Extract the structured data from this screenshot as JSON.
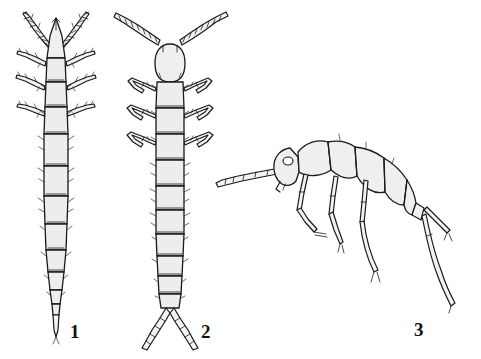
{
  "plate": {
    "background_color": "#ffffff",
    "ink_color": "#1a1a1a",
    "body_fill_color": "#ededed",
    "body_fill_light": "#f4f4f4",
    "width": 481,
    "height": 359
  },
  "figures": [
    {
      "id": "figure-1",
      "label": "1",
      "view": "dorsal",
      "description": "elongate larva, dorsal view, triangular head with two spiny antennae, three pairs of spiny legs, tapering segmented abdomen ending in a point",
      "segment_count": 11,
      "leg_pairs": 3,
      "antenna_type": "spiny",
      "cerci": "none"
    },
    {
      "id": "figure-2",
      "label": "2",
      "view": "dorsal",
      "description": "elongate larva, dorsal view, rounded head with long beaded segmented antennae in a V, three pairs of bent legs, parallel-sided abdomen ending in two segmented cerci",
      "segment_count": 11,
      "leg_pairs": 3,
      "antenna_type": "beaded-segmented",
      "cerci": "two segmented cerci"
    },
    {
      "id": "figure-3",
      "label": "3",
      "view": "lateral",
      "description": "adult insect, lateral view, head with eye and long segmented antenna pointing forward-left, three legs with jointed tarsi, humped segmented thorax and abdomen, two long curving cerci trailing behind",
      "segment_count": 9,
      "leg_pairs": 3,
      "antenna_type": "long-segmented",
      "cerci": "two long tapering cerci"
    }
  ],
  "labels": {
    "figure_1": "1",
    "figure_2": "2",
    "figure_3": "3"
  }
}
